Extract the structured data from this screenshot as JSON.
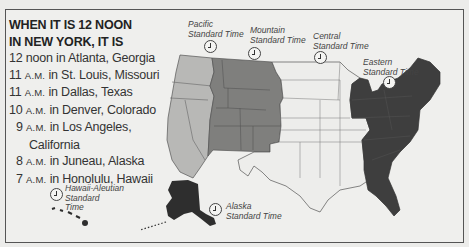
{
  "legend": {
    "title_line1": "WHEN IT IS 12 NOON",
    "title_line2": "IN NEW YORK, IT IS",
    "rows": [
      {
        "time": "12 noon",
        "suffix": "",
        "place": " in Atlanta, Georgia"
      },
      {
        "time": "11 ",
        "suffix": "A.M.",
        "place": " in St. Louis, Missouri"
      },
      {
        "time": "11 ",
        "suffix": "A.M.",
        "place": " in Dallas, Texas"
      },
      {
        "time": "10 ",
        "suffix": "A.M.",
        "place": " in Denver, Colorado"
      },
      {
        "time": "9 ",
        "suffix": "A.M.",
        "place": " in Los Angeles,"
      },
      {
        "time": "",
        "suffix": "",
        "place": "California"
      },
      {
        "time": "8 ",
        "suffix": "A.M.",
        "place": " in Juneau, Alaska"
      },
      {
        "time": "7 ",
        "suffix": "A.M.",
        "place": " in Honolulu, Hawaii"
      }
    ]
  },
  "zones": {
    "pacific": {
      "line1": "Pacific",
      "line2": "Standard Time",
      "color": "#b8b8b6"
    },
    "mountain": {
      "line1": "Mountain",
      "line2": "Standard Time",
      "color": "#7f7f7d"
    },
    "central": {
      "line1": "Central",
      "line2": "Standard Time",
      "color": "#ededeb"
    },
    "eastern": {
      "line1": "Eastern",
      "line2": "Standard Time",
      "color": "#3e3e3e"
    },
    "alaska": {
      "line1": "Alaska",
      "line2": "Standard Time",
      "color": "#2e2e2e"
    },
    "hawaii": {
      "line1": "Hawaii-Aleutian",
      "line2": "Standard",
      "line3": "Time",
      "color": "#2e2e2e"
    }
  },
  "icons": {
    "clock": "clock-icon"
  }
}
